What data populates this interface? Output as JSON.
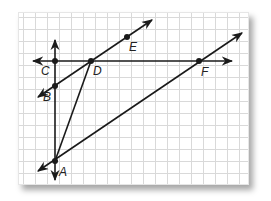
{
  "diagram": {
    "type": "geometry-graph-paper",
    "colors": {
      "line": "#1a1a1a",
      "grid": "#d9d9d9",
      "paper": "#ffffff"
    },
    "points": [
      {
        "name": "A",
        "x": 55,
        "y": 161,
        "label_dx": 4,
        "label_dy": 15
      },
      {
        "name": "B",
        "x": 55,
        "y": 86,
        "label_dx": -12,
        "label_dy": 15
      },
      {
        "name": "C",
        "x": 55,
        "y": 61,
        "label_dx": -14,
        "label_dy": 14
      },
      {
        "name": "D",
        "x": 91,
        "y": 61,
        "label_dx": 2,
        "label_dy": 14
      },
      {
        "name": "E",
        "x": 127,
        "y": 37,
        "label_dx": 2,
        "label_dy": 14
      },
      {
        "name": "F",
        "x": 199,
        "y": 61,
        "label_dx": 2,
        "label_dy": 15
      }
    ],
    "labels": {
      "A": "A",
      "B": "B",
      "C": "C",
      "D": "D",
      "E": "E",
      "F": "F"
    },
    "lines": [
      {
        "name": "line-AC-vertical",
        "x1": 55,
        "y1": 40,
        "x2": 55,
        "y2": 180,
        "arrow_start": true,
        "arrow_end": true
      },
      {
        "name": "line-CF-horizontal",
        "x1": 33,
        "y1": 61,
        "x2": 232,
        "y2": 61,
        "arrow_start": true,
        "arrow_end": true
      },
      {
        "name": "line-BE",
        "x1": 38,
        "y1": 97,
        "x2": 152,
        "y2": 20,
        "arrow_start": true,
        "arrow_end": true
      },
      {
        "name": "line-AF",
        "x1": 38,
        "y1": 171,
        "x2": 242,
        "y2": 33,
        "arrow_start": true,
        "arrow_end": true
      },
      {
        "name": "segment-AD",
        "x1": 55,
        "y1": 161,
        "x2": 91,
        "y2": 61,
        "arrow_start": false,
        "arrow_end": false
      }
    ]
  }
}
